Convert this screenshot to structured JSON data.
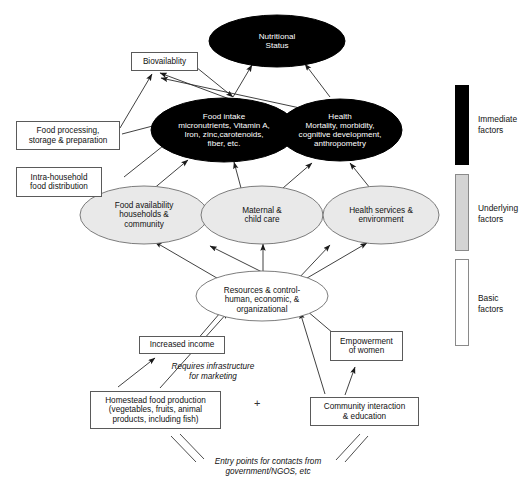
{
  "diagram": {
    "nodes": {
      "nutritional_status": "Nutritional\nStatus",
      "bioavailability": "Biovailablity",
      "food_intake": "Food intake\nmicronutrients, Vitamin A,\nIron, zinc,carotenoids,\nfiber, etc.",
      "health": "Health\nMortality, morbidity,\ncognitive development,\nanthropometry",
      "food_processing": "Food processing,\nstorage & preparation",
      "intra_household": "Intra-household\nfood distribution",
      "food_availability": "Food availability\nhouseholds &\ncommunity",
      "maternal_child_care": "Maternal &\nchild care",
      "health_services": "Health services &\nenvironment",
      "resources_control": "Resources & control-\nhuman, economic, &\norganizational",
      "increased_income": "Increased income",
      "empowerment": "Empowerment\nof women",
      "homestead": "Homestead food production\n(vegetables, fruits, animal\nproducts, including fish)",
      "community_interaction": "Community interaction\n& education"
    },
    "annotations": {
      "requires_infrastructure": "Requires infrastructure\nfor marketing",
      "plus": "+",
      "entry_points": "Entry points for contacts from\ngovernment/NGOS, etc"
    },
    "legend": {
      "items": [
        {
          "label": "Immediate\nfactors",
          "color": "#000000"
        },
        {
          "label": "Underlying\nfactors",
          "color": "#d4d4d4"
        },
        {
          "label": "Basic\nfactors",
          "color": "#ffffff"
        }
      ]
    },
    "colors": {
      "dark_node": "#000000",
      "gray_node": "#e9e9e9",
      "outline": "#5a5a5a",
      "background": "#ffffff"
    }
  }
}
